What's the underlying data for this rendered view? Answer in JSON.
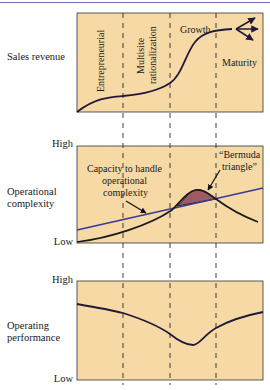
{
  "colors": {
    "panel_fill": "#f6d9a4",
    "curve": "#1f1a3a",
    "capacity_line": "#3a3a9a",
    "bermuda_fill": "#9e5a62",
    "dash": "#2a2a2a"
  },
  "stages": [
    "Entrepreneurial",
    "Multisite rationalization",
    "Growth",
    "Maturity"
  ],
  "panels": {
    "sales": {
      "label": "Sales revenue"
    },
    "complexity": {
      "label_line1": "Operational",
      "label_line2": "complexity",
      "high": "High",
      "low": "Low",
      "capacity_label_1": "Capacity to handle",
      "capacity_label_2": "operational",
      "capacity_label_3": "complexity",
      "bermuda_label_1": "“Bermuda",
      "bermuda_label_2": "triangle”"
    },
    "performance": {
      "label_line1": "Operating",
      "label_line2": "performance",
      "high": "High",
      "low": "Low"
    }
  },
  "stage_text": {
    "entrepreneurial": "Entrepreneurial",
    "multisite_1": "Multisite",
    "multisite_2": "rationalization",
    "growth": "Growth",
    "maturity": "Maturity"
  }
}
